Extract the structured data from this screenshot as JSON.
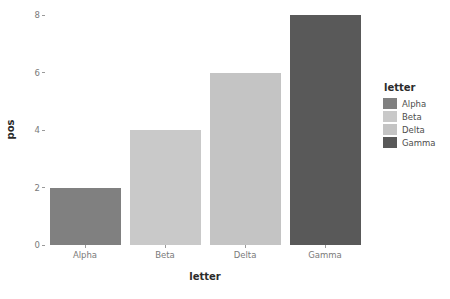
{
  "chart_data": {
    "type": "bar",
    "title": "",
    "subtitle": "",
    "xlabel": "letter",
    "ylabel": "pos",
    "categories": [
      "Alpha",
      "Beta",
      "Delta",
      "Gamma"
    ],
    "values": [
      2,
      4,
      6,
      8
    ],
    "series": [
      {
        "name": "pos",
        "values": [
          2,
          4,
          6,
          8
        ]
      }
    ],
    "ylim": [
      0,
      8
    ],
    "y_ticks": [
      "0",
      "2",
      "4",
      "6",
      "8"
    ],
    "y_tick_values": [
      0,
      2,
      4,
      6,
      8
    ],
    "x_ticks": [
      "Alpha",
      "Beta",
      "Delta",
      "Gamma"
    ],
    "grid": false,
    "legend_position": "right",
    "legend_title": "letter",
    "legend_entries": [
      {
        "label": "Alpha",
        "color": "#808080",
        "value": 2
      },
      {
        "label": "Beta",
        "color": "#c9c9c9",
        "value": 4
      },
      {
        "label": "Delta",
        "color": "#c4c4c4",
        "value": 6
      },
      {
        "label": "Gamma",
        "color": "#595959",
        "value": 8
      }
    ],
    "bar_colors": [
      "#808080",
      "#c9c9c9",
      "#c4c4c4",
      "#595959"
    ],
    "background_color": "#ffffff",
    "axis_text_color": "#7a7a7a",
    "axis_title_color": "#2b2b2b"
  }
}
